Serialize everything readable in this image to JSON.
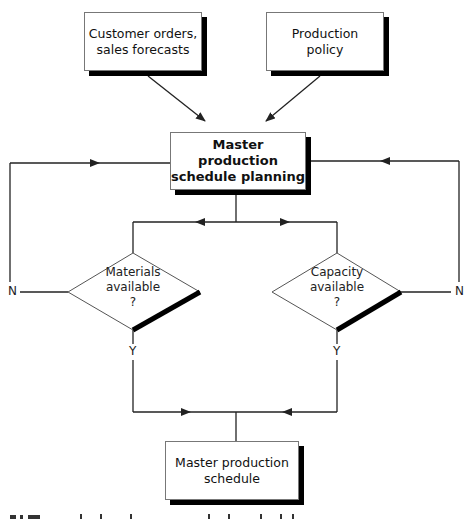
{
  "nodes": {
    "customer_orders": {
      "label": "Customer orders,\nsales forecasts",
      "line1": "Customer orders,",
      "line2": "sales forecasts"
    },
    "production_policy": {
      "line1": "Production",
      "line2": "policy"
    },
    "mps_planning": {
      "line1": "Master production",
      "line2": "schedule planning"
    },
    "materials_decision": {
      "line1": "Materials",
      "line2": "available",
      "line3": "?"
    },
    "capacity_decision": {
      "line1": "Capacity",
      "line2": "available",
      "line3": "?"
    },
    "mps": {
      "line1": "Master production",
      "line2": "schedule"
    }
  },
  "edge_labels": {
    "materials_no": "N",
    "materials_yes": "Y",
    "capacity_no": "N",
    "capacity_yes": "Y"
  },
  "colors": {
    "line": "#222222",
    "shadow": "#000000",
    "border": "#777777"
  }
}
